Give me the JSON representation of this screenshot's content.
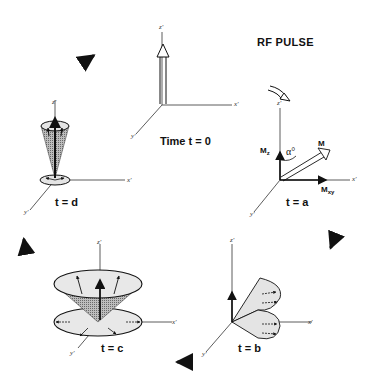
{
  "title": "RF PULSE",
  "panels": {
    "t0": {
      "label": "Time  t = 0",
      "axes": {
        "z": "z'",
        "x": "x'",
        "y": "y'"
      }
    },
    "ta": {
      "label": "t = a",
      "axes": {
        "z": "z'",
        "x": "x'",
        "y": "y'"
      },
      "vectors": {
        "m": "M",
        "mz": "M",
        "mz_sub": "z",
        "mxy": "M",
        "mxy_sub": "xy"
      },
      "angle": "α°"
    },
    "tb": {
      "label": "t = b",
      "axes": {
        "z": "z'",
        "x": "x'",
        "y": "y'"
      }
    },
    "tc": {
      "label": "t = c",
      "axes": {
        "z": "z'",
        "x": "x'",
        "y": "y'"
      }
    },
    "td": {
      "label": "t = d",
      "axes": {
        "z": "z'",
        "x": "x'",
        "y": "y'"
      }
    }
  },
  "colors": {
    "ink": "#111111",
    "shade_light": "#e4e4e4",
    "shade_dark": "#8a8a8a",
    "background": "#ffffff"
  }
}
